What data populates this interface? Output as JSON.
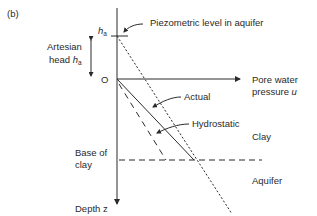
{
  "panel_label": "(b)",
  "axes": {
    "origin_label": "O",
    "x_axis_label_line1": "Pore water",
    "x_axis_label_line2": "pressure ",
    "x_axis_symbol": "u",
    "y_axis_label": "Depth z"
  },
  "ha_tick": {
    "symbol": "h",
    "subscript": "a"
  },
  "artesian": {
    "line1": "Artesian",
    "line2_prefix": "head ",
    "symbol": "h",
    "subscript": "a"
  },
  "annotations": {
    "piezometric": "Piezometric level in aquifer",
    "actual": "Actual",
    "hydrostatic": "Hydrostatic",
    "base_of_clay_line1": "Base of",
    "base_of_clay_line2": "clay"
  },
  "layers": {
    "upper": "Clay",
    "lower": "Aquifer"
  },
  "colors": {
    "line": "#2a2a2a",
    "background": "#ffffff"
  }
}
